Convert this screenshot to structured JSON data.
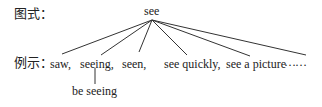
{
  "labels": {
    "pattern": "图式：",
    "example": "例示："
  },
  "root": "see",
  "children": [
    {
      "text": "saw,"
    },
    {
      "text": "seeing,"
    },
    {
      "text": "seen,"
    },
    {
      "text": "see quickly,"
    },
    {
      "text": "see a picture"
    },
    {
      "text": "……"
    }
  ],
  "sub_child": {
    "parent": "seeing,",
    "text": "be seeing"
  },
  "colors": {
    "line": "#333333",
    "text": "#222222"
  }
}
